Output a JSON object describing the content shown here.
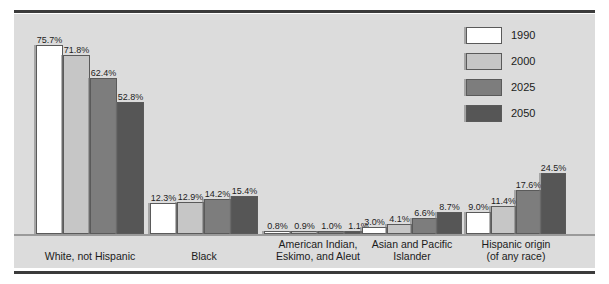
{
  "chart_data": {
    "type": "bar",
    "title": "",
    "subtitle": "",
    "xlabel": "",
    "ylabel": "",
    "ylim": [
      0,
      80
    ],
    "grid": false,
    "legend_position": "top-right",
    "value_suffix": "%",
    "categories": [
      "White, not Hispanic",
      "Black",
      "American Indian,\nEskimo, and Aleut",
      "Asian and Pacific\nIslander",
      "Hispanic origin\n(of any race)"
    ],
    "series": [
      {
        "name": "1990",
        "color": "#ffffff",
        "values": [
          75.7,
          12.3,
          0.8,
          3.0,
          9.0
        ],
        "labels": [
          "75.7%",
          "12.3%",
          "0.8%",
          "3.0%",
          "9.0%"
        ]
      },
      {
        "name": "2000",
        "color": "#c6c6c6",
        "values": [
          71.8,
          12.9,
          0.9,
          4.1,
          11.4
        ],
        "labels": [
          "71.8%",
          "12.9%",
          "0.9%",
          "4.1%",
          "11.4%"
        ]
      },
      {
        "name": "2025",
        "color": "#7d7d7d",
        "values": [
          62.4,
          14.2,
          1.0,
          6.6,
          17.6
        ],
        "labels": [
          "62.4%",
          "14.2%",
          "1.0%",
          "6.6%",
          "17.6%"
        ]
      },
      {
        "name": "2050",
        "color": "#565656",
        "values": [
          52.8,
          15.4,
          1.1,
          8.7,
          24.5
        ],
        "labels": [
          "52.8%",
          "15.4%",
          "1.1%",
          "8.7%",
          "24.5%"
        ]
      }
    ]
  },
  "legend": {
    "items": [
      {
        "label": "1990",
        "color": "#ffffff"
      },
      {
        "label": "2000",
        "color": "#c6c6c6"
      },
      {
        "label": "2025",
        "color": "#7d7d7d"
      },
      {
        "label": "2050",
        "color": "#565656"
      }
    ]
  },
  "colors": {
    "plot_background": "#dcdcdc",
    "page_background": "#ffffff",
    "rule": "#3b3b3b",
    "baseline": "#9a9a9a",
    "text": "#1b1b1b"
  }
}
